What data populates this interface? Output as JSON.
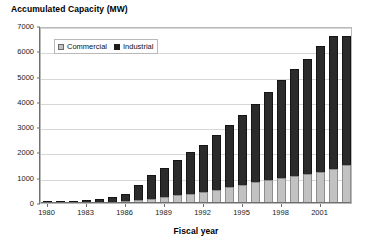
{
  "chart_data": {
    "type": "bar",
    "subtype": "stacked-column",
    "title": "Accumulated Capacity (MW)",
    "xlabel": "Fiscal year",
    "ylabel": "",
    "ylim": [
      0,
      7000
    ],
    "ytick_step": 1000,
    "yticks": [
      "0",
      "1000",
      "2000",
      "3000",
      "4000",
      "5000",
      "6000",
      "7000"
    ],
    "grid": true,
    "grid_axis": "y",
    "legend": {
      "position": "inside-top-left",
      "entries": [
        {
          "name": "Commercial",
          "color": "#c2c2c2"
        },
        {
          "name": "Industrial",
          "color": "#2b2b2b"
        }
      ]
    },
    "categories": [
      "1980",
      "1981",
      "1982",
      "1983",
      "1984",
      "1985",
      "1986",
      "1987",
      "1988",
      "1989",
      "1990",
      "1991",
      "1992",
      "1993",
      "1994",
      "1995",
      "1996",
      "1997",
      "1998",
      "1999",
      "2000",
      "2001",
      "2002",
      "2003"
    ],
    "xtick_labels": [
      "1980",
      "1983",
      "1986",
      "1989",
      "1992",
      "1995",
      "1998",
      "2001"
    ],
    "xtick_indices": [
      0,
      3,
      6,
      9,
      12,
      15,
      18,
      21
    ],
    "series": [
      {
        "name": "Commercial",
        "color": "#c2c2c2",
        "values": [
          10,
          12,
          15,
          25,
          35,
          50,
          70,
          110,
          170,
          240,
          300,
          360,
          430,
          520,
          620,
          720,
          820,
          900,
          980,
          1060,
          1130,
          1230,
          1340,
          1500
        ]
      },
      {
        "name": "Industrial",
        "color": "#2b2b2b",
        "values": [
          20,
          28,
          40,
          75,
          115,
          180,
          280,
          590,
          930,
          1160,
          1400,
          1640,
          1870,
          2180,
          2480,
          2780,
          3080,
          3500,
          3880,
          4240,
          4570,
          4970,
          5260,
          5100
        ]
      }
    ],
    "totals": [
      30,
      40,
      55,
      100,
      150,
      230,
      350,
      700,
      1100,
      1400,
      1700,
      2000,
      2300,
      2700,
      3100,
      3500,
      3900,
      4400,
      4860,
      5300,
      5700,
      6200,
      6600,
      6600
    ]
  }
}
